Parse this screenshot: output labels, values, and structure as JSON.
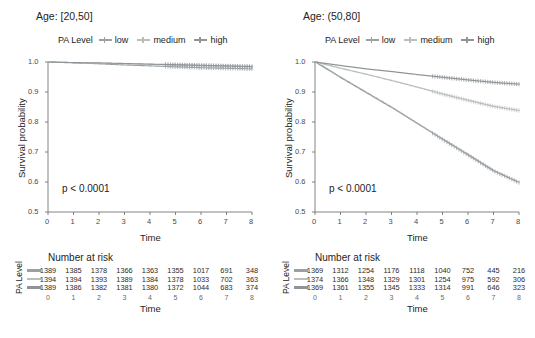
{
  "panels": [
    {
      "facet_title": "Age: [20,50]",
      "legend_title": "PA Level",
      "pvalue": "p < 0.0001",
      "risk_title": "Number at risk",
      "risk_ylab": "PA Level"
    },
    {
      "facet_title": "Age: (50,80]",
      "legend_title": "PA Level",
      "pvalue": "p < 0.0001",
      "risk_title": "Number at risk",
      "risk_ylab": "PA Level"
    }
  ],
  "legend_labels": [
    "low",
    "medium",
    "high"
  ],
  "colors": {
    "low": "#9aa0a4",
    "medium": "#b9c0bc",
    "high": "#8f9498",
    "axis": "#666666",
    "text": "#242424"
  },
  "axis": {
    "ylabel": "Survival probability",
    "xlabel": "Time",
    "yticks": [
      "1.0",
      "0.9",
      "0.8",
      "0.7",
      "0.6",
      "0.5"
    ],
    "ytick_values": [
      1.0,
      0.9,
      0.8,
      0.7,
      0.6,
      0.5
    ],
    "xticks": [
      "0",
      "1",
      "2",
      "3",
      "4",
      "5",
      "6",
      "7",
      "8"
    ],
    "xtick_values": [
      0,
      1,
      2,
      3,
      4,
      5,
      6,
      7,
      8
    ],
    "ylim": [
      0.5,
      1.0
    ],
    "xlim": [
      0,
      8
    ]
  },
  "chart_data": [
    {
      "type": "line",
      "title": "Age: [20,50]",
      "xlabel": "Time",
      "ylabel": "Survival probability",
      "xlim": [
        0,
        8
      ],
      "ylim": [
        0.5,
        1.0
      ],
      "grid": false,
      "legend_position": "top",
      "annotation": "p < 0.0001",
      "x": [
        0,
        1,
        2,
        3,
        4,
        5,
        6,
        7,
        8
      ],
      "series": [
        {
          "name": "low",
          "values": [
            1.0,
            0.997,
            0.994,
            0.99,
            0.987,
            0.984,
            0.981,
            0.979,
            0.977
          ]
        },
        {
          "name": "medium",
          "values": [
            1.0,
            0.998,
            0.996,
            0.994,
            0.992,
            0.99,
            0.988,
            0.986,
            0.984
          ]
        },
        {
          "name": "high",
          "values": [
            1.0,
            0.998,
            0.997,
            0.995,
            0.993,
            0.991,
            0.989,
            0.987,
            0.985
          ]
        }
      ],
      "risk_table": {
        "title": "Number at risk",
        "ylabel": "PA Level",
        "rows": [
          {
            "name": "low",
            "values": [
              1389,
              1385,
              1378,
              1366,
              1363,
              1355,
              1017,
              691,
              348
            ]
          },
          {
            "name": "medium",
            "values": [
              1394,
              1394,
              1393,
              1389,
              1384,
              1378,
              1033,
              702,
              363
            ]
          },
          {
            "name": "high",
            "values": [
              1389,
              1386,
              1382,
              1381,
              1380,
              1372,
              1044,
              683,
              374
            ]
          }
        ]
      }
    },
    {
      "type": "line",
      "title": "Age: (50,80]",
      "xlabel": "Time",
      "ylabel": "Survival probability",
      "xlim": [
        0,
        8
      ],
      "ylim": [
        0.5,
        1.0
      ],
      "grid": false,
      "legend_position": "top",
      "annotation": "p < 0.0001",
      "x": [
        0,
        1,
        2,
        3,
        4,
        5,
        6,
        7,
        8
      ],
      "series": [
        {
          "name": "low",
          "values": [
            1.0,
            0.948,
            0.898,
            0.848,
            0.795,
            0.742,
            0.69,
            0.637,
            0.598
          ]
        },
        {
          "name": "medium",
          "values": [
            1.0,
            0.979,
            0.959,
            0.938,
            0.916,
            0.893,
            0.872,
            0.852,
            0.838
          ]
        },
        {
          "name": "high",
          "values": [
            1.0,
            0.988,
            0.977,
            0.968,
            0.958,
            0.949,
            0.94,
            0.932,
            0.926
          ]
        }
      ],
      "risk_table": {
        "title": "Number at risk",
        "ylabel": "PA Level",
        "rows": [
          {
            "name": "low",
            "values": [
              1369,
              1312,
              1254,
              1176,
              1118,
              1040,
              752,
              445,
              216
            ]
          },
          {
            "name": "medium",
            "values": [
              1374,
              1366,
              1348,
              1329,
              1301,
              1254,
              975,
              592,
              306
            ]
          },
          {
            "name": "high",
            "values": [
              1369,
              1361,
              1355,
              1345,
              1333,
              1314,
              991,
              646,
              323
            ]
          }
        ]
      }
    }
  ]
}
